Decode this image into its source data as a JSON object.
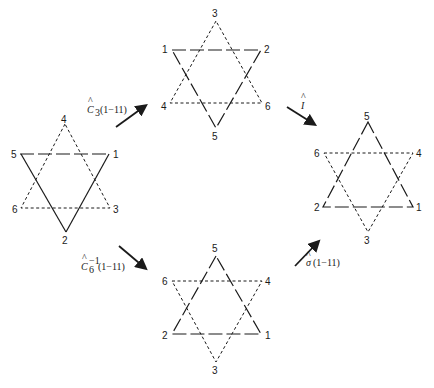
{
  "figure": {
    "stars": [
      {
        "id": "initial",
        "position": "left",
        "labels": {
          "top": "4",
          "upper_left": "5",
          "upper_right": "1",
          "lower_left": "6",
          "lower_right": "3",
          "bottom": "2"
        }
      },
      {
        "id": "after-c3",
        "position": "top",
        "labels": {
          "top": "3",
          "upper_left": "1",
          "upper_right": "2",
          "lower_left": "4",
          "lower_right": "6",
          "bottom": "5"
        }
      },
      {
        "id": "after-inversion",
        "position": "right",
        "labels": {
          "top": "5",
          "upper_left": "6",
          "upper_right": "4",
          "lower_left": "2",
          "lower_right": "1",
          "bottom": "3"
        }
      },
      {
        "id": "after-c6-inverse",
        "position": "bottom",
        "labels": {
          "top": "5",
          "upper_left": "6",
          "upper_right": "4",
          "lower_left": "2",
          "lower_right": "1",
          "bottom": "3"
        }
      }
    ],
    "operations": [
      {
        "id": "c3",
        "symbol": "C",
        "hat": "^",
        "subscript": "3",
        "superscript": "",
        "argument": "(1−11)"
      },
      {
        "id": "inversion",
        "symbol": "I",
        "hat": "^",
        "subscript": "",
        "superscript": "",
        "argument": ""
      },
      {
        "id": "c6-inverse",
        "symbol": "C",
        "hat": "^",
        "subscript": "6",
        "superscript": "−1",
        "argument": "(1−11)"
      },
      {
        "id": "sigma",
        "symbol": "σ",
        "hat": "^",
        "subscript": "",
        "superscript": "",
        "argument": "(1−11)"
      }
    ]
  }
}
